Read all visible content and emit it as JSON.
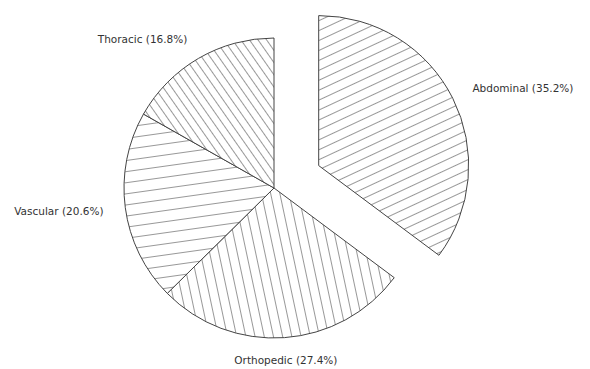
{
  "chart_data": {
    "type": "pie",
    "title": "",
    "start": "top",
    "direction": "clockwise",
    "exploded": [
      "Abdominal"
    ],
    "slices": [
      {
        "label": "Abdominal",
        "value": 35.2,
        "display": "Abdominal (35.2%)",
        "hatch": "diag-shallow"
      },
      {
        "label": "Orthopedic",
        "value": 27.4,
        "display": "Orthopedic (27.4%)",
        "hatch": "near-vertical"
      },
      {
        "label": "Vascular",
        "value": 20.6,
        "display": "Vascular (20.6%)",
        "hatch": "near-horizontal"
      },
      {
        "label": "Thoracic",
        "value": 16.8,
        "display": "Thoracic (16.8%)",
        "hatch": "diag-steep"
      }
    ],
    "colors": {
      "line": "#444444",
      "text": "#333333",
      "background": "#ffffff"
    }
  }
}
